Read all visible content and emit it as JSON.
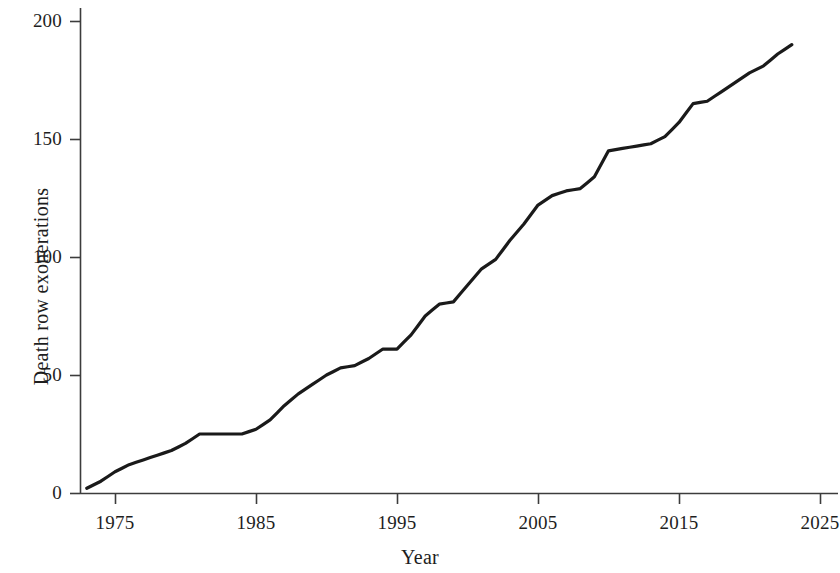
{
  "chart_data": {
    "type": "line",
    "title": "",
    "subtitle": "",
    "xlabel": "Year",
    "ylabel": "Death row exonerations",
    "xlim": [
      1973,
      2026
    ],
    "ylim": [
      0,
      207
    ],
    "xticks": [
      1975,
      1985,
      1995,
      2005,
      2015,
      2025
    ],
    "xtick_labels": [
      "1975",
      "1985",
      "1995",
      "2005",
      "2015",
      "2025"
    ],
    "yticks": [
      0,
      50,
      100,
      150,
      200
    ],
    "ytick_labels": [
      "0",
      "50",
      "100",
      "150",
      "200"
    ],
    "grid": false,
    "legend": null,
    "annotations": [],
    "line_color": "#1a1a1a",
    "line_width": 3.2,
    "series": [
      {
        "name": "Cumulative death row exonerations",
        "x": [
          1973,
          1974,
          1975,
          1976,
          1977,
          1978,
          1979,
          1980,
          1981,
          1982,
          1983,
          1984,
          1985,
          1986,
          1987,
          1988,
          1989,
          1990,
          1991,
          1992,
          1993,
          1994,
          1995,
          1996,
          1997,
          1998,
          1999,
          2000,
          2001,
          2002,
          2003,
          2004,
          2005,
          2006,
          2007,
          2008,
          2009,
          2010,
          2011,
          2012,
          2013,
          2014,
          2015,
          2016,
          2017,
          2018,
          2019,
          2020,
          2021,
          2022,
          2023
        ],
        "values": [
          2,
          5,
          9,
          12,
          14,
          16,
          18,
          21,
          25,
          25,
          25,
          25,
          27,
          31,
          37,
          42,
          46,
          50,
          53,
          54,
          57,
          61,
          61,
          67,
          75,
          80,
          81,
          88,
          95,
          99,
          107,
          114,
          122,
          126,
          128,
          129,
          134,
          145,
          146,
          147,
          148,
          151,
          157,
          165,
          166,
          170,
          174,
          178,
          181,
          186,
          190
        ]
      }
    ]
  },
  "axes": {
    "pixel_mapping": {
      "x_year_1975": 115,
      "x_year_2025": 820,
      "y_value_0": 493,
      "y_value_200": 21
    }
  }
}
